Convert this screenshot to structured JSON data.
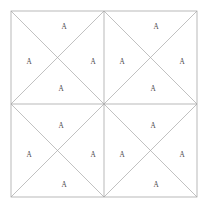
{
  "figure": {
    "background_color": "#ffffff",
    "line_color": "#9b9b9b",
    "diagonal_color": "#a6a6a6",
    "label_color": "#4a4a4a",
    "outer_square": {
      "x": 11,
      "y": 11,
      "width": 186,
      "height": 186
    },
    "grid": {
      "rows": 2,
      "cols": 2,
      "cell_size": 93
    },
    "center": {
      "x": 104,
      "y": 104
    },
    "label_text": "A",
    "label_count": 16,
    "cells": [
      {
        "name": "top-left",
        "x": 11,
        "y": 11,
        "size": 93,
        "labels": [
          {
            "position": "top",
            "text": "A",
            "x": 64,
            "y": 27
          },
          {
            "position": "left",
            "text": "A",
            "x": 29,
            "y": 62
          },
          {
            "position": "right",
            "text": "A",
            "x": 93,
            "y": 62
          },
          {
            "position": "bottom",
            "text": "A",
            "x": 61,
            "y": 89
          }
        ]
      },
      {
        "name": "top-right",
        "x": 104,
        "y": 11,
        "size": 93,
        "labels": [
          {
            "position": "top",
            "text": "A",
            "x": 156,
            "y": 27
          },
          {
            "position": "left",
            "text": "A",
            "x": 122,
            "y": 62
          },
          {
            "position": "right",
            "text": "A",
            "x": 182,
            "y": 62
          },
          {
            "position": "bottom",
            "text": "A",
            "x": 153,
            "y": 89
          }
        ]
      },
      {
        "name": "bottom-left",
        "x": 11,
        "y": 104,
        "size": 93,
        "labels": [
          {
            "position": "top",
            "text": "A",
            "x": 61,
            "y": 126
          },
          {
            "position": "left",
            "text": "A",
            "x": 29,
            "y": 155
          },
          {
            "position": "right",
            "text": "A",
            "x": 93,
            "y": 155
          },
          {
            "position": "bottom",
            "text": "A",
            "x": 64,
            "y": 185
          }
        ]
      },
      {
        "name": "bottom-right",
        "x": 104,
        "y": 104,
        "size": 93,
        "labels": [
          {
            "position": "top",
            "text": "A",
            "x": 153,
            "y": 126
          },
          {
            "position": "left",
            "text": "A",
            "x": 122,
            "y": 155
          },
          {
            "position": "right",
            "text": "A",
            "x": 182,
            "y": 155
          },
          {
            "position": "bottom",
            "text": "A",
            "x": 156,
            "y": 185
          }
        ]
      }
    ]
  }
}
